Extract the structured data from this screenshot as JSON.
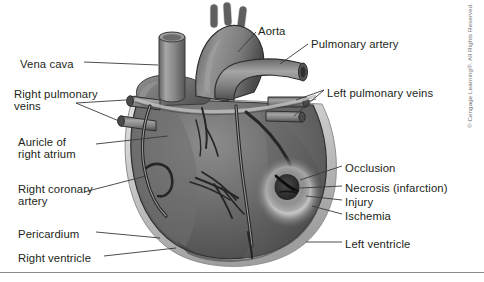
{
  "figure": {
    "background_color": "#ffffff",
    "text_color": "#231f20",
    "width": 484,
    "height": 282
  },
  "colors": {
    "heart_muscle": "#6a6a6a",
    "heart_muscle_dark": "#4f4f4f",
    "heart_muscle_light": "#8a8a8a",
    "vessel": "#808080",
    "vessel_dark": "#5a5a5a",
    "vessel_light": "#a8a8a8",
    "pericardium": "#c9c9c9",
    "necrosis": "#2e2e2e",
    "injury": "#909090",
    "ischemia": "#cfcfcf",
    "leader_line": "#3a3a3a",
    "outline": "#2b2b2b"
  },
  "labels": {
    "left": [
      {
        "id": "vena-cava",
        "text": "Vena cava",
        "x": 20,
        "y": 58
      },
      {
        "id": "right-pulmonary-veins",
        "text": "Right pulmonary\nveins",
        "x": 14,
        "y": 88
      },
      {
        "id": "auricle-of-right-atrium",
        "text": "Auricle of\nright atrium",
        "x": 18,
        "y": 136
      },
      {
        "id": "right-coronary-artery",
        "text": "Right coronary\nartery",
        "x": 18,
        "y": 183
      },
      {
        "id": "pericardium",
        "text": "Pericardium",
        "x": 18,
        "y": 228
      },
      {
        "id": "right-ventricle",
        "text": "Right ventricle",
        "x": 18,
        "y": 252
      }
    ],
    "right": [
      {
        "id": "aorta",
        "text": "Aorta",
        "x": 258,
        "y": 25
      },
      {
        "id": "pulmonary-artery",
        "text": "Pulmonary artery",
        "x": 311,
        "y": 38
      },
      {
        "id": "left-pulmonary-veins",
        "text": "Left pulmonary veins",
        "x": 327,
        "y": 87
      },
      {
        "id": "occlusion",
        "text": "Occlusion",
        "x": 345,
        "y": 162
      },
      {
        "id": "necrosis-infarction",
        "text": "Necrosis (infarction)",
        "x": 345,
        "y": 182
      },
      {
        "id": "injury",
        "text": "Injury",
        "x": 345,
        "y": 196
      },
      {
        "id": "ischemia",
        "text": "Ischemia",
        "x": 345,
        "y": 210
      },
      {
        "id": "left-ventricle",
        "text": "Left ventricle",
        "x": 345,
        "y": 238
      }
    ]
  },
  "copyright": {
    "text": "© Cengage Learning®. All Rights Reserved."
  }
}
